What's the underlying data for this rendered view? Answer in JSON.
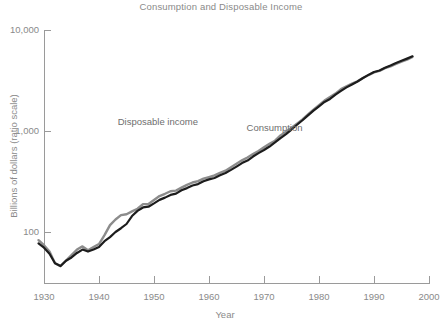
{
  "chart_data": {
    "type": "line",
    "title": "Consumption and Disposable Income",
    "xlabel": "Year",
    "ylabel": "Billions of dollars (ratio scale)",
    "yscale": "log",
    "xlim": [
      1929,
      1997
    ],
    "ylim": [
      40,
      10000
    ],
    "grid": false,
    "legend_position": "inline-annotation",
    "x_ticks": [
      "1930",
      "1940",
      "1950",
      "1960",
      "1970",
      "1980",
      "1990",
      "2000"
    ],
    "x_tick_values": [
      1930,
      1940,
      1950,
      1960,
      1970,
      1980,
      1990,
      2000
    ],
    "y_ticks": [
      "100",
      "1,000",
      "10,000"
    ],
    "y_tick_values": [
      100,
      1000,
      10000
    ],
    "x": [
      1929,
      1930,
      1931,
      1932,
      1933,
      1934,
      1935,
      1936,
      1937,
      1938,
      1939,
      1940,
      1941,
      1942,
      1943,
      1944,
      1945,
      1946,
      1947,
      1948,
      1949,
      1950,
      1951,
      1952,
      1953,
      1954,
      1955,
      1956,
      1957,
      1958,
      1959,
      1960,
      1961,
      1962,
      1963,
      1964,
      1965,
      1966,
      1967,
      1968,
      1969,
      1970,
      1971,
      1972,
      1973,
      1974,
      1975,
      1976,
      1977,
      1978,
      1979,
      1980,
      1981,
      1982,
      1983,
      1984,
      1985,
      1986,
      1987,
      1988,
      1989,
      1990,
      1991,
      1992,
      1993,
      1994,
      1995,
      1996,
      1997
    ],
    "series": [
      {
        "name": "Disposable income",
        "color": "#8c8c8c",
        "label_x": 1958,
        "label_y": 1150,
        "values": [
          83,
          74,
          64,
          49,
          46,
          52,
          59,
          67,
          72,
          66,
          71,
          76,
          93,
          117,
          133,
          147,
          150,
          160,
          170,
          189,
          189,
          207,
          227,
          239,
          253,
          257,
          275,
          293,
          309,
          319,
          337,
          350,
          364,
          385,
          405,
          438,
          473,
          512,
          547,
          591,
          634,
          691,
          746,
          802,
          903,
          983,
          1076,
          1182,
          1303,
          1458,
          1623,
          1800,
          2002,
          2174,
          2344,
          2600,
          2772,
          2941,
          3110,
          3344,
          3580,
          3811,
          3945,
          4185,
          4366,
          4611,
          4858,
          5087,
          5425
        ]
      },
      {
        "name": "Consumption",
        "color": "#1c1c1c",
        "label_x": 1977,
        "label_y": 1000,
        "values": [
          77,
          70,
          61,
          49,
          46,
          52,
          56,
          62,
          67,
          64,
          67,
          71,
          81,
          89,
          100,
          109,
          120,
          144,
          162,
          175,
          178,
          192,
          208,
          219,
          233,
          240,
          259,
          272,
          289,
          298,
          318,
          332,
          343,
          364,
          384,
          412,
          444,
          481,
          509,
          559,
          604,
          648,
          702,
          771,
          852,
          933,
          1034,
          1152,
          1278,
          1428,
          1592,
          1757,
          1941,
          2077,
          2291,
          2493,
          2704,
          2892,
          3094,
          3350,
          3594,
          3839,
          3975,
          4220,
          4454,
          4717,
          4954,
          5208,
          5486
        ]
      }
    ]
  },
  "axis_titles": {
    "x": "Year",
    "y": "Billions of dollars (ratio scale)"
  }
}
